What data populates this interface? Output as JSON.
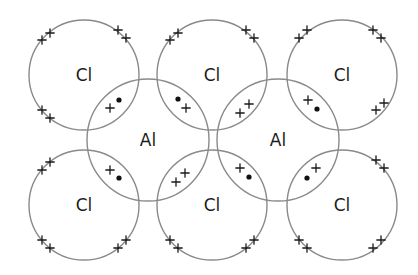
{
  "diagram": {
    "colors": {
      "circle_stroke": "#8a8a8a",
      "text": "#1c1c1c",
      "electron": "#111111",
      "background": "#ffffff"
    },
    "atoms": [
      {
        "id": "cl-top-left",
        "symbol": "Cl",
        "cx": 84,
        "cy": 75,
        "r": 55
      },
      {
        "id": "cl-top-middle",
        "symbol": "Cl",
        "cx": 212,
        "cy": 75,
        "r": 55
      },
      {
        "id": "cl-top-right",
        "symbol": "Cl",
        "cx": 342,
        "cy": 75,
        "r": 55
      },
      {
        "id": "al-left",
        "symbol": "Al",
        "cx": 148,
        "cy": 140,
        "r": 61
      },
      {
        "id": "al-right",
        "symbol": "Al",
        "cx": 278,
        "cy": 140,
        "r": 61
      },
      {
        "id": "cl-bottom-left",
        "symbol": "Cl",
        "cx": 84,
        "cy": 205,
        "r": 55
      },
      {
        "id": "cl-bottom-middle",
        "symbol": "Cl",
        "cx": 212,
        "cy": 205,
        "r": 55
      },
      {
        "id": "cl-bottom-right",
        "symbol": "Cl",
        "cx": 342,
        "cy": 205,
        "r": 55
      }
    ],
    "electron_legend": {
      "cross": "chlorine electron",
      "dot": "aluminium electron"
    },
    "lone_pairs": [
      {
        "atom": "cl-top-left",
        "crosses": [
          [
            42,
            40
          ],
          [
            50,
            33
          ],
          [
            118,
            30
          ],
          [
            126,
            38
          ],
          [
            42,
            110
          ],
          [
            50,
            118
          ]
        ]
      },
      {
        "atom": "cl-top-middle",
        "crosses": [
          [
            170,
            40
          ],
          [
            178,
            33
          ],
          [
            246,
            30
          ],
          [
            254,
            38
          ]
        ]
      },
      {
        "atom": "cl-top-right",
        "crosses": [
          [
            299,
            38
          ],
          [
            307,
            30
          ],
          [
            373,
            30
          ],
          [
            381,
            38
          ],
          [
            376,
            110
          ],
          [
            384,
            103
          ]
        ]
      },
      {
        "atom": "cl-bottom-left",
        "crosses": [
          [
            42,
            170
          ],
          [
            50,
            162
          ],
          [
            42,
            240
          ],
          [
            50,
            248
          ],
          [
            118,
            248
          ],
          [
            126,
            240
          ]
        ]
      },
      {
        "atom": "cl-bottom-middle",
        "crosses": [
          [
            170,
            240
          ],
          [
            178,
            248
          ],
          [
            246,
            248
          ],
          [
            254,
            240
          ]
        ]
      },
      {
        "atom": "cl-bottom-right",
        "crosses": [
          [
            376,
            160
          ],
          [
            384,
            168
          ],
          [
            299,
            240
          ],
          [
            307,
            248
          ],
          [
            373,
            248
          ],
          [
            381,
            240
          ]
        ]
      }
    ],
    "bond_pairs": [
      {
        "between": [
          "cl-top-left",
          "al-left"
        ],
        "crosses": [
          [
            110,
            108
          ]
        ],
        "dots": [
          [
            119,
            100
          ]
        ]
      },
      {
        "between": [
          "cl-top-middle",
          "al-left"
        ],
        "crosses": [
          [
            186,
            108
          ]
        ],
        "dots": [
          [
            178,
            99
          ]
        ]
      },
      {
        "between": [
          "cl-bottom-left",
          "al-left"
        ],
        "crosses": [
          [
            110,
            170
          ]
        ],
        "dots": [
          [
            119,
            178
          ]
        ]
      },
      {
        "between": [
          "cl-bottom-middle",
          "al-left"
        ],
        "crosses": [
          [
            176,
            182
          ],
          [
            185,
            173
          ]
        ],
        "dots": []
      },
      {
        "between": [
          "cl-top-middle",
          "al-right"
        ],
        "crosses": [
          [
            240,
            113
          ],
          [
            249,
            104
          ]
        ],
        "dots": []
      },
      {
        "between": [
          "cl-top-right",
          "al-right"
        ],
        "crosses": [
          [
            308,
            100
          ]
        ],
        "dots": [
          [
            317,
            109
          ]
        ]
      },
      {
        "between": [
          "cl-bottom-middle",
          "al-right"
        ],
        "crosses": [
          [
            240,
            168
          ]
        ],
        "dots": [
          [
            249,
            177
          ]
        ]
      },
      {
        "between": [
          "cl-bottom-right",
          "al-right"
        ],
        "crosses": [
          [
            316,
            168
          ]
        ],
        "dots": [
          [
            307,
            178
          ]
        ]
      }
    ]
  }
}
